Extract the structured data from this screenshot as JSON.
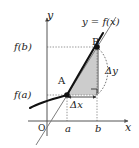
{
  "figure": {
    "kind": "calculus-mean-value-diagram",
    "background_color": "#ffffff",
    "axes": {
      "y_axis_label": "y",
      "x_axis_label": "x",
      "origin_label": "O",
      "axis_color": "#555555"
    },
    "y_ticks": [
      {
        "name": "f-of-b",
        "label": "f(b)",
        "y_px": 47
      },
      {
        "name": "f-of-a",
        "label": "f(a)",
        "y_px": 95
      }
    ],
    "x_ticks": [
      {
        "name": "a",
        "label": "a",
        "x_px": 67
      },
      {
        "name": "b",
        "label": "b",
        "x_px": 97
      }
    ],
    "curve": {
      "label": "y = f(x)",
      "color": "#111111",
      "description": "increasing convex curve through A and B"
    },
    "secant_line": {
      "color": "#777777",
      "description": "straight line through A and B, extended past both ends"
    },
    "points": [
      {
        "name": "point-a",
        "label": "A",
        "x_px": 67,
        "y_px": 95
      },
      {
        "name": "point-b",
        "label": "B",
        "x_px": 97,
        "y_px": 47
      }
    ],
    "annotations": {
      "delta_y_label": "Δy",
      "delta_x_label": "Δx",
      "right_angle_marker": true,
      "dashed_arc": true
    },
    "shaded_region": {
      "name": "area-between-curve-and-chord",
      "fill_color": "#c8c8c8"
    },
    "guide_lines": {
      "style": "dotted",
      "color": "#888888"
    }
  }
}
